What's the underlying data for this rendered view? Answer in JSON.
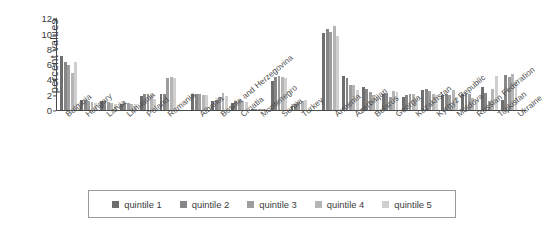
{
  "chart": {
    "type": "bar",
    "ylabel": "percent values",
    "ytick_labels": [
      "0",
      "2",
      "4",
      "6",
      "8",
      "10",
      "12"
    ]
  },
  "legend": {
    "items": [
      {
        "label": "quintile 1",
        "color": "#6e6e6e"
      },
      {
        "label": "quintile 2",
        "color": "#868686"
      },
      {
        "label": "quintile 3",
        "color": "#9d9d9d"
      },
      {
        "label": "quintile 4",
        "color": "#b5b5b5"
      },
      {
        "label": "quintile 5",
        "color": "#cfcfcf"
      }
    ]
  },
  "chart_data": {
    "type": "bar",
    "title": "",
    "xlabel": "",
    "ylabel": "percent values",
    "ylim": [
      0,
      12
    ],
    "yticks": [
      0,
      2,
      4,
      6,
      8,
      10,
      12
    ],
    "grid": false,
    "legend_position": "bottom",
    "categories": [
      "Bulgaria",
      "Hungary",
      "Latvia",
      "Lithuania",
      "Poland",
      "Romania",
      "Albania",
      "Bosnia and Herzegovina",
      "Croatia",
      "Montenegro",
      "Serbia",
      "Turkey",
      "Armenia",
      "Azerbaijan",
      "Belarus",
      "Georgia",
      "Kazakhstan",
      "Kyrgyz Republic",
      "Moldova",
      "Russian Federation",
      "Tajikistan",
      "Ukraine"
    ],
    "group_breaks": [
      6,
      12
    ],
    "series": [
      {
        "name": "quintile 1",
        "color": "#6e6e6e",
        "values": [
          7.0,
          1.2,
          1.1,
          0.8,
          1.8,
          2.0,
          2.0,
          1.1,
          0.9,
          0.1,
          3.7,
          0.5,
          10.0,
          4.4,
          3.0,
          2.1,
          1.6,
          2.6,
          1.9,
          2.1,
          3.0,
          1.3
        ]
      },
      {
        "name": "quintile 2",
        "color": "#868686",
        "values": [
          6.3,
          1.2,
          1.1,
          0.9,
          2.0,
          2.1,
          2.1,
          1.3,
          1.1,
          0.1,
          4.3,
          0.7,
          10.6,
          4.1,
          2.7,
          2.2,
          1.9,
          2.7,
          2.0,
          2.2,
          2.2,
          4.6
        ]
      },
      {
        "name": "quintile 3",
        "color": "#9d9d9d",
        "values": [
          5.8,
          1.1,
          1.0,
          0.9,
          2.0,
          4.2,
          2.0,
          1.6,
          1.2,
          0.1,
          4.4,
          1.0,
          10.2,
          3.2,
          2.3,
          1.6,
          2.0,
          2.5,
          1.9,
          2.0,
          1.1,
          4.3
        ]
      },
      {
        "name": "quintile 4",
        "color": "#b5b5b5",
        "values": [
          4.8,
          1.0,
          0.9,
          0.8,
          1.9,
          4.3,
          1.9,
          2.2,
          1.1,
          0.1,
          4.3,
          1.1,
          11.0,
          3.2,
          1.9,
          2.4,
          2.1,
          2.1,
          2.6,
          1.5,
          2.7,
          4.7
        ]
      },
      {
        "name": "quintile 5",
        "color": "#cfcfcf",
        "values": [
          6.3,
          0.9,
          0.8,
          0.7,
          1.4,
          4.2,
          1.9,
          1.8,
          1.0,
          0.1,
          4.2,
          1.2,
          9.6,
          2.6,
          1.6,
          2.3,
          1.5,
          1.9,
          1.6,
          1.2,
          4.4,
          3.9
        ]
      }
    ]
  }
}
